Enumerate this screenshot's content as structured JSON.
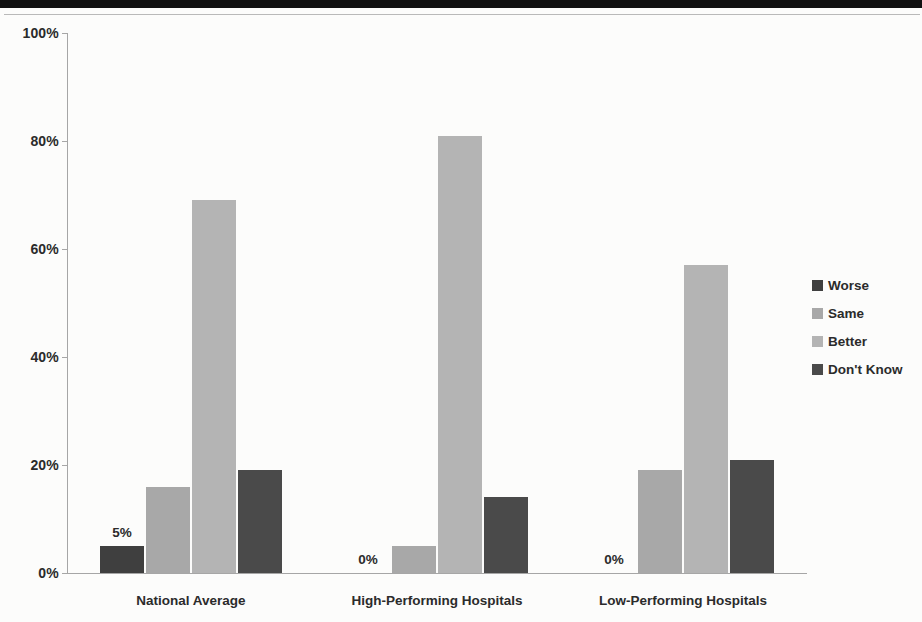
{
  "page": {
    "background_color": "#fcfcfb",
    "top_band_color": "#111111"
  },
  "legend": {
    "position": "right",
    "items": [
      {
        "label": "Worse",
        "color": "#3f3f3f"
      },
      {
        "label": "Same",
        "color": "#a8a8a8"
      },
      {
        "label": "Better",
        "color": "#b4b4b4"
      },
      {
        "label": "Don't Know",
        "color": "#4a4a4a"
      }
    ]
  },
  "chart_data": {
    "type": "bar",
    "title": "",
    "xlabel": "",
    "ylabel": "",
    "ylim": [
      0,
      100
    ],
    "ytick_labels": [
      "0%",
      "20%",
      "40%",
      "60%",
      "80%",
      "100%"
    ],
    "ytick_values": [
      0,
      20,
      40,
      60,
      80,
      100
    ],
    "grid": false,
    "legend_position": "right",
    "categories": [
      "National Average",
      "High-Performing Hospitals",
      "Low-Performing Hospitals"
    ],
    "series": [
      {
        "name": "Worse",
        "color": "#3f3f3f",
        "values": [
          5,
          0,
          0
        ]
      },
      {
        "name": "Same",
        "color": "#a8a8a8",
        "values": [
          16,
          5,
          19
        ]
      },
      {
        "name": "Better",
        "color": "#b4b4b4",
        "values": [
          69,
          81,
          57
        ]
      },
      {
        "name": "Don't Know",
        "color": "#4a4a4a",
        "values": [
          19,
          14,
          21
        ]
      }
    ],
    "data_labels": [
      {
        "category": "National Average",
        "series": "Worse",
        "text": "5%"
      },
      {
        "category": "High-Performing Hospitals",
        "series": "Worse",
        "text": "0%"
      },
      {
        "category": "Low-Performing Hospitals",
        "series": "Worse",
        "text": "0%"
      }
    ]
  }
}
